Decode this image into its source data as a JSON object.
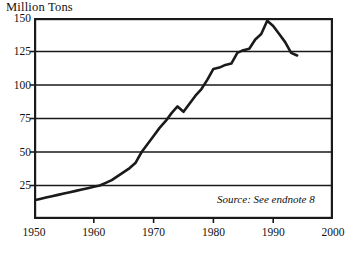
{
  "chart_data": {
    "type": "line",
    "title": "Million Tons",
    "xlabel": "",
    "ylabel": "Million Tons",
    "xlim": [
      1950,
      2000
    ],
    "ylim": [
      0,
      150
    ],
    "grid": "horizontal",
    "legend": "none",
    "x_ticks": [
      1950,
      1960,
      1970,
      1980,
      1990,
      2000
    ],
    "x_tick_labels": [
      "1950",
      "1960",
      "1970",
      "1980",
      "1990",
      "2000"
    ],
    "y_ticks": [
      25,
      50,
      75,
      100,
      125,
      150
    ],
    "y_tick_labels": [
      "25",
      "50",
      "75",
      "100",
      "125",
      "150"
    ],
    "annotations": [
      {
        "name": "source",
        "text": "Source: See endnote 8",
        "style": "italic"
      }
    ],
    "series": [
      {
        "name": "World Fertilizer Use",
        "color": "#1a1a1a",
        "x": [
          1950,
          1951,
          1952,
          1953,
          1954,
          1955,
          1956,
          1957,
          1958,
          1959,
          1960,
          1961,
          1962,
          1963,
          1964,
          1965,
          1966,
          1967,
          1968,
          1969,
          1970,
          1971,
          1972,
          1973,
          1974,
          1975,
          1976,
          1977,
          1978,
          1979,
          1980,
          1981,
          1982,
          1983,
          1984,
          1985,
          1986,
          1987,
          1988,
          1989,
          1990,
          1991,
          1992,
          1993,
          1994
        ],
        "values": [
          14,
          15,
          16,
          17,
          18,
          19,
          20,
          21,
          22,
          23,
          24,
          25,
          27,
          29,
          32,
          35,
          38,
          42,
          50,
          56,
          62,
          68,
          73,
          79,
          84,
          80,
          86,
          92,
          97,
          104,
          112,
          113,
          115,
          116,
          124,
          126,
          127,
          134,
          138,
          148,
          144,
          138,
          132,
          124,
          122
        ]
      }
    ]
  },
  "axis_title": {
    "label": "Million Tons"
  },
  "source": {
    "text": "Source: See endnote 8"
  }
}
